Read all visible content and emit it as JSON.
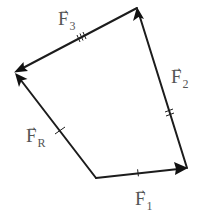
{
  "diagram": {
    "title": "",
    "type": "force-polygon",
    "colors": {
      "line": "#1c1c1c",
      "label": "#555555",
      "background": "#ffffff"
    },
    "vertices": {
      "A": {
        "x": 96,
        "y": 178
      },
      "B": {
        "x": 187,
        "y": 168
      },
      "C": {
        "x": 137,
        "y": 8
      },
      "D": {
        "x": 15,
        "y": 72
      }
    },
    "vectors": [
      {
        "id": "F1",
        "from": "A",
        "to": "B",
        "label_base": "F",
        "label_sub": "1",
        "arrow_glyph": "→",
        "tick_marks": 1
      },
      {
        "id": "F2",
        "from": "B",
        "to": "C",
        "label_base": "F",
        "label_sub": "2",
        "arrow_glyph": "→",
        "tick_marks": 2
      },
      {
        "id": "F3",
        "from": "C",
        "to": "D",
        "label_base": "F",
        "label_sub": "3",
        "arrow_glyph": "→",
        "tick_marks": 3
      },
      {
        "id": "FR",
        "from": "A",
        "to": "D",
        "label_base": "F",
        "label_sub": "R",
        "arrow_glyph": "→",
        "tick_marks": 1
      }
    ]
  }
}
